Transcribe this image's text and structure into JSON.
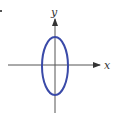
{
  "diagram": {
    "axes": {
      "x_label": "x",
      "y_label": "y",
      "color": "#555555"
    },
    "ellipse": {
      "shape": "vertical ellipse centered at origin",
      "color": "#3a4aa8"
    },
    "bullet": "•"
  }
}
